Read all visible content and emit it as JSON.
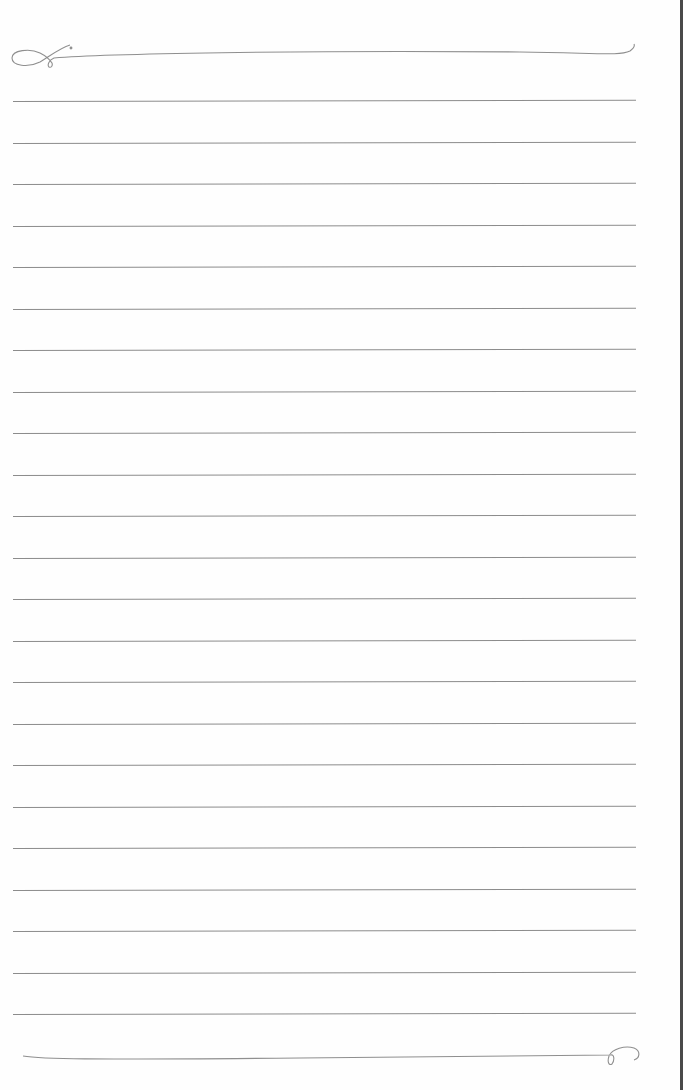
{
  "paper": {
    "type": "lined-notebook-page",
    "line_color": "#8c8c8c",
    "background": "#fefefe",
    "edge_color": "#4a4a4a",
    "line_count": 23,
    "line_spacing_px": 41.5,
    "first_line_y": 101,
    "top_flourish_y": 56,
    "bottom_flourish_y": 1055
  }
}
